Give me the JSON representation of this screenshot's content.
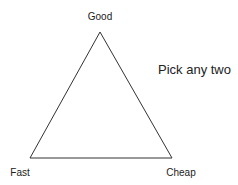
{
  "diagram": {
    "type": "triangle",
    "vertices": {
      "top": "Good",
      "bottom_left": "Fast",
      "bottom_right": "Cheap"
    },
    "caption": "Pick any two"
  }
}
